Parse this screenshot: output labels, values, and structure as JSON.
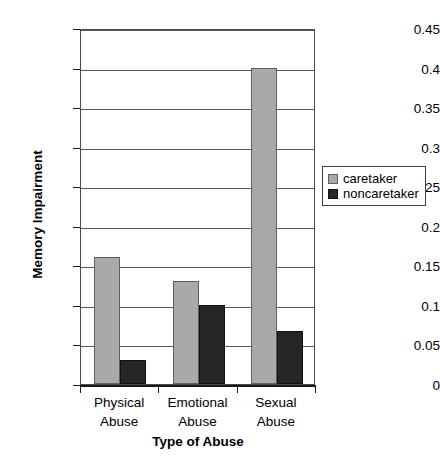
{
  "chart_data": {
    "type": "bar",
    "title": "",
    "xlabel": "Type of Abuse",
    "ylabel": "Memory Impairment",
    "categories": [
      "Physical Abuse",
      "Emotional Abuse",
      "Sexual Abuse"
    ],
    "category_lines": [
      [
        "Physical",
        "Abuse"
      ],
      [
        "Emotional",
        "Abuse"
      ],
      [
        "Sexual",
        "Abuse"
      ]
    ],
    "series": [
      {
        "name": "caretaker",
        "values": [
          0.16,
          0.13,
          0.4
        ],
        "color": "#a9a9a9"
      },
      {
        "name": "noncaretaker",
        "values": [
          0.03,
          0.1,
          0.067
        ],
        "color": "#262626"
      }
    ],
    "ylim": [
      0,
      0.45
    ],
    "yticks": [
      0,
      0.05,
      0.1,
      0.15,
      0.2,
      0.25,
      0.3,
      0.35,
      0.4,
      0.45
    ],
    "ytick_labels": [
      "0",
      "0.05",
      "0.1",
      "0.15",
      "0.2",
      "0.25",
      "0.3",
      "0.35",
      "0.4",
      "0.45"
    ],
    "grid": true,
    "legend_position": "center right"
  }
}
